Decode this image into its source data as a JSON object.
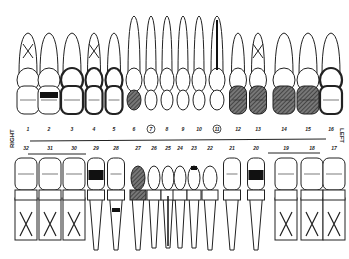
{
  "labels": {
    "right": "RIGHT",
    "left": "LEFT"
  },
  "upper": {
    "numbers": [
      "1",
      "2",
      "3",
      "4",
      "5",
      "6",
      "7",
      "8",
      "9",
      "10",
      "11",
      "12",
      "13",
      "14",
      "15",
      "16"
    ],
    "circled": [
      "7",
      "11"
    ],
    "teeth": [
      {
        "n": "1",
        "type": "molar",
        "roots_x": true,
        "fill": "none"
      },
      {
        "n": "2",
        "type": "molar",
        "roots_x": false,
        "fill": "black-occlusal"
      },
      {
        "n": "3",
        "type": "molar",
        "roots_x": false,
        "fill": "crown-outline-heavy"
      },
      {
        "n": "4",
        "type": "premolar",
        "roots_x": true,
        "fill": "crown-outline-heavy"
      },
      {
        "n": "5",
        "type": "premolar",
        "roots_x": false,
        "fill": "crown-outline-heavy"
      },
      {
        "n": "6",
        "type": "canine",
        "roots_x": false,
        "fill": "hatched-crown"
      },
      {
        "n": "7",
        "type": "incisor",
        "roots_x": false,
        "fill": "none"
      },
      {
        "n": "8",
        "type": "incisor",
        "roots_x": false,
        "fill": "none"
      },
      {
        "n": "9",
        "type": "incisor",
        "roots_x": false,
        "fill": "none"
      },
      {
        "n": "10",
        "type": "incisor",
        "roots_x": false,
        "fill": "none"
      },
      {
        "n": "11",
        "type": "canine",
        "roots_x": false,
        "fill": "root-canal-crown"
      },
      {
        "n": "12",
        "type": "premolar",
        "roots_x": false,
        "fill": "hatched"
      },
      {
        "n": "13",
        "type": "premolar",
        "roots_x": true,
        "fill": "hatched"
      },
      {
        "n": "14",
        "type": "molar",
        "roots_x": false,
        "fill": "hatched"
      },
      {
        "n": "15",
        "type": "molar",
        "roots_x": false,
        "fill": "hatched-partial"
      },
      {
        "n": "16",
        "type": "molar",
        "roots_x": false,
        "fill": "outlined-heavy"
      }
    ]
  },
  "lower": {
    "numbers": [
      "32",
      "31",
      "30",
      "29",
      "28",
      "27",
      "26",
      "25",
      "24",
      "23",
      "22",
      "21",
      "20",
      "19",
      "18",
      "17"
    ],
    "underlined": [
      "32-30",
      "19-17"
    ],
    "teeth": [
      {
        "n": "32",
        "type": "molar",
        "roots_x": true,
        "fill": "none"
      },
      {
        "n": "31",
        "type": "molar",
        "roots_x": true,
        "fill": "none"
      },
      {
        "n": "30",
        "type": "molar",
        "roots_x": true,
        "fill": "none"
      },
      {
        "n": "29",
        "type": "premolar",
        "roots_x": false,
        "fill": "black-occlusal"
      },
      {
        "n": "28",
        "type": "premolar",
        "roots_x": false,
        "fill": "black-cervical"
      },
      {
        "n": "27",
        "type": "canine",
        "roots_x": false,
        "fill": "hatched"
      },
      {
        "n": "26",
        "type": "incisor",
        "roots_x": false,
        "fill": "none"
      },
      {
        "n": "25",
        "type": "incisor",
        "roots_x": false,
        "fill": "root-canal"
      },
      {
        "n": "24",
        "type": "incisor",
        "roots_x": false,
        "fill": "none"
      },
      {
        "n": "23",
        "type": "incisor",
        "roots_x": false,
        "fill": "black-small"
      },
      {
        "n": "22",
        "type": "canine",
        "roots_x": false,
        "fill": "crown-outline"
      },
      {
        "n": "21",
        "type": "premolar",
        "roots_x": false,
        "fill": "none"
      },
      {
        "n": "20",
        "type": "premolar",
        "roots_x": false,
        "fill": "black-occlusal"
      },
      {
        "n": "19",
        "type": "molar",
        "roots_x": true,
        "fill": "none"
      },
      {
        "n": "18",
        "type": "molar",
        "roots_x": true,
        "fill": "none"
      },
      {
        "n": "17",
        "type": "molar",
        "roots_x": true,
        "fill": "none"
      }
    ]
  }
}
